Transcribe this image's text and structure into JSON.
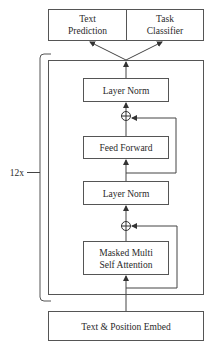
{
  "diagram": {
    "outputs": [
      {
        "id": "text-prediction",
        "lines": [
          "Text",
          "Prediction"
        ]
      },
      {
        "id": "task-classifier",
        "lines": [
          "Task",
          "Classifier"
        ]
      }
    ],
    "block": {
      "repeat_label": "12x",
      "layers": [
        {
          "id": "layer-norm-top",
          "lines": [
            "Layer Norm"
          ]
        },
        {
          "id": "add-top",
          "symbol": "⊕"
        },
        {
          "id": "feed-forward",
          "lines": [
            "Feed Forward"
          ]
        },
        {
          "id": "layer-norm-bottom",
          "lines": [
            "Layer Norm"
          ]
        },
        {
          "id": "add-bottom",
          "symbol": "⊕"
        },
        {
          "id": "masked-attention",
          "lines": [
            "Masked Multi",
            "Self Attention"
          ]
        }
      ]
    },
    "input": {
      "id": "text-position-embed",
      "lines": [
        "Text & Position Embed"
      ]
    }
  }
}
